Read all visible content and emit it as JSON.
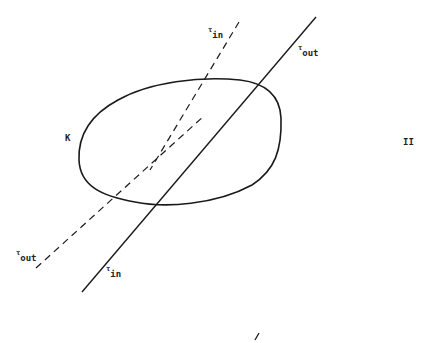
{
  "diagram": {
    "region_label": "K",
    "figure_label": "II",
    "labels": {
      "tau_in_top": {
        "symbol": "τ",
        "sub": "in"
      },
      "tau_out_top": {
        "symbol": "τ",
        "sub": "out"
      },
      "tau_out_bottom": {
        "symbol": "τ",
        "sub": "out"
      },
      "tau_in_bottom": {
        "symbol": "τ",
        "sub": "in"
      }
    },
    "colors": {
      "stroke": "#1a1a1a",
      "background": "#ffffff"
    }
  }
}
